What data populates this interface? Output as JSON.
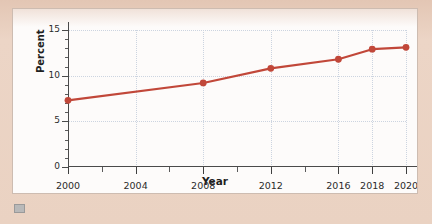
{
  "chart_data": {
    "type": "line",
    "title": "",
    "xlabel": "Year",
    "ylabel": "Percent",
    "x": [
      2000,
      2008,
      2012,
      2016,
      2018,
      2020
    ],
    "values": [
      7.3,
      9.2,
      10.8,
      11.8,
      12.9,
      13.1
    ],
    "series": [
      {
        "name": "Percent",
        "x": [
          2000,
          2008,
          2012,
          2016,
          2018,
          2020
        ],
        "values": [
          7.3,
          9.2,
          10.8,
          11.8,
          12.9,
          13.1
        ]
      }
    ],
    "xlim": [
      2000,
      2020
    ],
    "ylim": [
      0,
      15
    ],
    "x_tick_labels": [
      "2000",
      "2004",
      "2008",
      "2012",
      "2016",
      "2018",
      "2020"
    ],
    "x_tick_values": [
      2000,
      2004,
      2008,
      2012,
      2016,
      2018,
      2020
    ],
    "x_minor_tick_values": [
      2002,
      2006,
      2010,
      2014
    ],
    "y_tick_labels": [
      "0",
      "5",
      "10",
      "15"
    ],
    "y_tick_values": [
      0,
      5,
      10,
      15
    ],
    "y_minor_tick_values": [
      1,
      2,
      3,
      4,
      6,
      7,
      8,
      9,
      11,
      12,
      13,
      14
    ],
    "grid": true,
    "legend": "none",
    "marker": "circle",
    "colors": {
      "line": "#c14739",
      "marker": "#c14739",
      "grid": "#ccd4e0",
      "axis": "#4a4a4a",
      "text": "#2b2b2b",
      "page_background": "#e9d0c1",
      "plot_background": "#fdfbfa",
      "card_border": "#cdbcb1"
    }
  },
  "figure": {
    "y_axis_title": "Percent",
    "x_axis_title": "Year"
  }
}
